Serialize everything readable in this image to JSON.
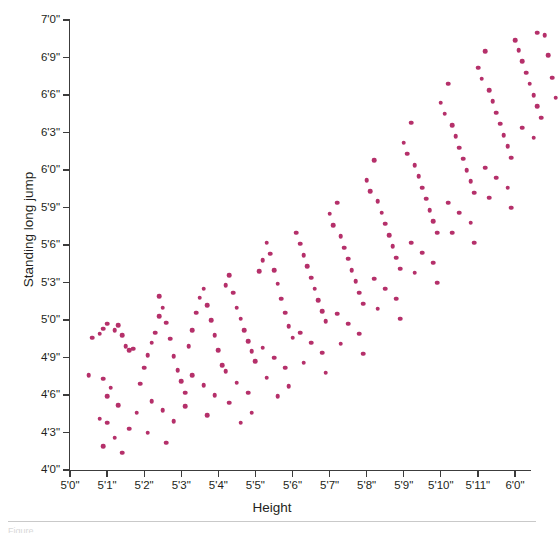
{
  "figure": {
    "caption_fragment": "Figure"
  },
  "axes": {
    "x": {
      "title": "Height",
      "tick_labels": [
        "5'0\"",
        "5'1\"",
        "5'2\"",
        "5'3\"",
        "5'4\"",
        "5'5\"",
        "5'6\"",
        "5'7\"",
        "5'8\"",
        "5'9\"",
        "5'10\"",
        "5'11\"",
        "6'0\""
      ],
      "tick_values_inches": [
        60,
        61,
        62,
        63,
        64,
        65,
        66,
        67,
        68,
        69,
        70,
        71,
        72
      ],
      "min_inches": 60,
      "max_inches": 72
    },
    "y": {
      "title": "Standing long jump",
      "tick_labels": [
        "4'0\"",
        "4'3\"",
        "4'6\"",
        "4'9\"",
        "5'0\"",
        "5'3\"",
        "5'6\"",
        "5'9\"",
        "6'0\"",
        "6'3\"",
        "6'6\"",
        "6'9\"",
        "7'0\""
      ],
      "tick_values_inches": [
        48,
        51,
        54,
        57,
        60,
        63,
        66,
        69,
        72,
        75,
        78,
        81,
        84
      ],
      "min_inches": 48,
      "max_inches": 84
    }
  },
  "style": {
    "point_color": "#b5306a",
    "axis_color": "#3c3c3c",
    "text_color": "#231f20",
    "background": "#ffffff"
  },
  "chart_data": {
    "type": "scatter",
    "title": "",
    "xlabel": "Height",
    "ylabel": "Standing long jump",
    "xlim": [
      60,
      72
    ],
    "ylim": [
      48,
      84
    ],
    "x_unit": "inches",
    "y_unit": "inches",
    "grid": false,
    "legend": false,
    "n_points": 191,
    "series": [
      {
        "name": "athletes",
        "color": "#b5306a",
        "points": [
          [
            60.8,
            58.9
          ],
          [
            60.9,
            59.3
          ],
          [
            61.0,
            59.7
          ],
          [
            61.2,
            59.2
          ],
          [
            61.3,
            59.6
          ],
          [
            61.4,
            58.8
          ],
          [
            60.6,
            58.6
          ],
          [
            61.5,
            57.9
          ],
          [
            61.6,
            57.6
          ],
          [
            61.7,
            57.7
          ],
          [
            60.5,
            55.6
          ],
          [
            60.9,
            55.3
          ],
          [
            61.1,
            54.6
          ],
          [
            61.0,
            53.9
          ],
          [
            61.3,
            53.2
          ],
          [
            60.8,
            52.1
          ],
          [
            61.0,
            51.8
          ],
          [
            61.6,
            51.3
          ],
          [
            61.2,
            50.6
          ],
          [
            60.9,
            49.9
          ],
          [
            61.4,
            49.4
          ],
          [
            61.8,
            52.6
          ],
          [
            61.9,
            54.9
          ],
          [
            62.0,
            56.2
          ],
          [
            62.1,
            57.2
          ],
          [
            62.2,
            58.2
          ],
          [
            62.3,
            59.0
          ],
          [
            62.4,
            60.3
          ],
          [
            62.5,
            61.0
          ],
          [
            62.6,
            59.8
          ],
          [
            62.7,
            58.5
          ],
          [
            62.8,
            57.1
          ],
          [
            62.9,
            56.0
          ],
          [
            63.0,
            55.1
          ],
          [
            63.1,
            54.2
          ],
          [
            62.2,
            53.5
          ],
          [
            62.5,
            52.8
          ],
          [
            62.8,
            51.9
          ],
          [
            62.1,
            51.0
          ],
          [
            62.6,
            50.2
          ],
          [
            63.2,
            57.9
          ],
          [
            63.3,
            59.2
          ],
          [
            63.4,
            60.6
          ],
          [
            63.5,
            61.8
          ],
          [
            63.6,
            62.5
          ],
          [
            63.7,
            61.2
          ],
          [
            63.8,
            60.0
          ],
          [
            63.9,
            58.8
          ],
          [
            64.0,
            57.6
          ],
          [
            64.1,
            56.4
          ],
          [
            63.3,
            55.6
          ],
          [
            63.6,
            54.8
          ],
          [
            63.9,
            54.0
          ],
          [
            63.1,
            53.1
          ],
          [
            63.7,
            52.4
          ],
          [
            64.2,
            62.8
          ],
          [
            64.3,
            63.6
          ],
          [
            64.4,
            62.2
          ],
          [
            64.5,
            61.0
          ],
          [
            64.6,
            60.1
          ],
          [
            64.7,
            59.2
          ],
          [
            64.8,
            58.3
          ],
          [
            64.9,
            57.5
          ],
          [
            65.0,
            56.7
          ],
          [
            64.2,
            55.9
          ],
          [
            64.5,
            55.0
          ],
          [
            64.8,
            54.2
          ],
          [
            64.3,
            53.4
          ],
          [
            64.9,
            52.6
          ],
          [
            64.6,
            51.8
          ],
          [
            65.1,
            63.9
          ],
          [
            65.2,
            64.8
          ],
          [
            65.3,
            66.2
          ],
          [
            65.4,
            65.3
          ],
          [
            65.5,
            64.0
          ],
          [
            65.6,
            62.9
          ],
          [
            65.7,
            61.7
          ],
          [
            65.8,
            60.6
          ],
          [
            65.9,
            59.5
          ],
          [
            66.0,
            58.6
          ],
          [
            65.2,
            57.8
          ],
          [
            65.5,
            57.0
          ],
          [
            65.8,
            56.2
          ],
          [
            65.3,
            55.4
          ],
          [
            65.9,
            54.7
          ],
          [
            65.6,
            53.9
          ],
          [
            66.1,
            67.0
          ],
          [
            66.2,
            66.1
          ],
          [
            66.3,
            65.2
          ],
          [
            66.4,
            64.3
          ],
          [
            66.5,
            63.4
          ],
          [
            66.6,
            62.5
          ],
          [
            66.7,
            61.6
          ],
          [
            66.8,
            60.7
          ],
          [
            66.9,
            59.9
          ],
          [
            66.2,
            59.0
          ],
          [
            66.5,
            58.2
          ],
          [
            66.8,
            57.4
          ],
          [
            66.3,
            56.6
          ],
          [
            66.9,
            55.8
          ],
          [
            67.0,
            68.5
          ],
          [
            67.1,
            67.6
          ],
          [
            67.2,
            69.4
          ],
          [
            67.3,
            66.7
          ],
          [
            67.4,
            65.8
          ],
          [
            67.5,
            64.9
          ],
          [
            67.6,
            64.0
          ],
          [
            67.7,
            63.1
          ],
          [
            67.8,
            62.2
          ],
          [
            67.9,
            61.3
          ],
          [
            67.2,
            60.5
          ],
          [
            67.5,
            59.7
          ],
          [
            67.8,
            58.9
          ],
          [
            67.3,
            58.1
          ],
          [
            67.9,
            57.3
          ],
          [
            68.0,
            71.2
          ],
          [
            68.1,
            70.3
          ],
          [
            68.2,
            72.8
          ],
          [
            68.3,
            69.5
          ],
          [
            68.4,
            68.6
          ],
          [
            68.5,
            67.7
          ],
          [
            68.6,
            66.8
          ],
          [
            68.7,
            65.9
          ],
          [
            68.8,
            65.0
          ],
          [
            68.9,
            64.1
          ],
          [
            68.2,
            63.3
          ],
          [
            68.5,
            62.5
          ],
          [
            68.8,
            61.7
          ],
          [
            68.3,
            60.9
          ],
          [
            68.9,
            60.1
          ],
          [
            69.0,
            74.2
          ],
          [
            69.1,
            73.3
          ],
          [
            69.2,
            75.8
          ],
          [
            69.3,
            72.4
          ],
          [
            69.4,
            71.5
          ],
          [
            69.5,
            70.6
          ],
          [
            69.6,
            69.7
          ],
          [
            69.7,
            68.8
          ],
          [
            69.8,
            67.9
          ],
          [
            69.9,
            67.0
          ],
          [
            69.2,
            66.2
          ],
          [
            69.5,
            65.4
          ],
          [
            69.8,
            64.6
          ],
          [
            69.3,
            63.8
          ],
          [
            69.9,
            63.0
          ],
          [
            70.0,
            77.4
          ],
          [
            70.1,
            76.5
          ],
          [
            70.2,
            78.9
          ],
          [
            70.3,
            75.6
          ],
          [
            70.4,
            74.7
          ],
          [
            70.5,
            73.8
          ],
          [
            70.6,
            72.9
          ],
          [
            70.7,
            72.0
          ],
          [
            70.8,
            71.1
          ],
          [
            70.9,
            70.2
          ],
          [
            70.2,
            69.4
          ],
          [
            70.5,
            68.6
          ],
          [
            70.8,
            67.8
          ],
          [
            70.3,
            67.0
          ],
          [
            70.9,
            66.2
          ],
          [
            71.0,
            80.2
          ],
          [
            71.1,
            79.3
          ],
          [
            71.2,
            81.5
          ],
          [
            71.3,
            78.4
          ],
          [
            71.4,
            77.5
          ],
          [
            71.5,
            76.6
          ],
          [
            71.6,
            75.7
          ],
          [
            71.7,
            74.8
          ],
          [
            71.8,
            73.9
          ],
          [
            71.9,
            73.0
          ],
          [
            71.2,
            72.2
          ],
          [
            71.5,
            71.4
          ],
          [
            71.8,
            70.6
          ],
          [
            71.3,
            69.8
          ],
          [
            71.9,
            69.0
          ],
          [
            72.0,
            82.4
          ],
          [
            72.1,
            81.6
          ],
          [
            72.2,
            80.7
          ],
          [
            72.3,
            79.8
          ],
          [
            72.4,
            78.9
          ],
          [
            72.5,
            78.0
          ],
          [
            72.6,
            77.1
          ],
          [
            72.7,
            76.2
          ],
          [
            72.2,
            75.4
          ],
          [
            72.5,
            74.6
          ],
          [
            72.8,
            82.8
          ],
          [
            72.9,
            81.2
          ],
          [
            73.0,
            79.4
          ],
          [
            73.1,
            77.8
          ],
          [
            72.6,
            83.0
          ],
          [
            62.4,
            61.9
          ]
        ]
      }
    ]
  }
}
